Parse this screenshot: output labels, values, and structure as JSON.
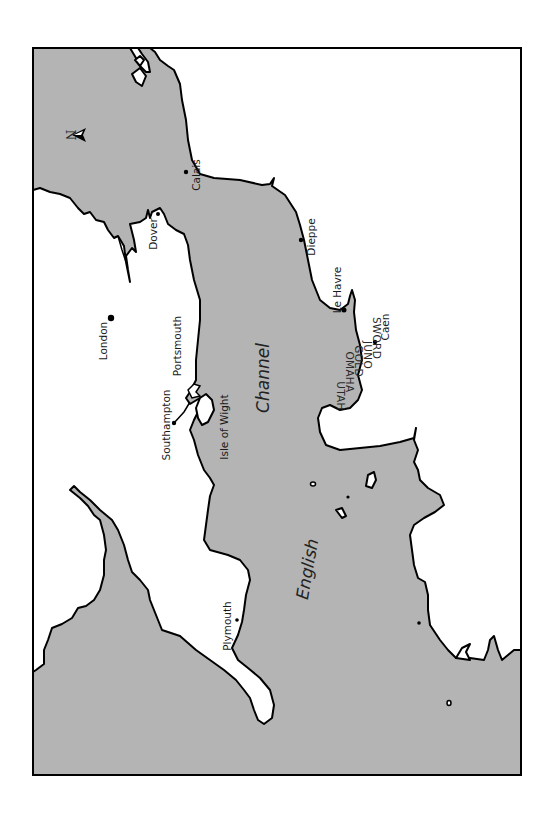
{
  "map": {
    "title": "English Channel",
    "orientation": "rotated 90 degrees - north points left",
    "colors": {
      "sea": "#b4b4b4",
      "land": "#ffffff",
      "coastline": "#000000",
      "frame": "#000000"
    },
    "compass": {
      "label": "N",
      "icon": "north-arrow-icon"
    },
    "sea_labels": {
      "english": "English",
      "channel": "Channel"
    },
    "cities": {
      "calais": "Calais",
      "dover": "Dover",
      "london": "London",
      "dieppe": "Dieppe",
      "le_havre": "Le Havre",
      "caen": "Caen",
      "portsmouth": "Portsmouth",
      "southampton": "Southampton",
      "isle_of_wight": "Isle of Wight",
      "plymouth": "Plymouth"
    },
    "beaches": {
      "utah": "UTAH",
      "omaha": "OMAHA",
      "gold": "GOLD",
      "juno": "JUNO",
      "sword": "SWORD"
    }
  }
}
